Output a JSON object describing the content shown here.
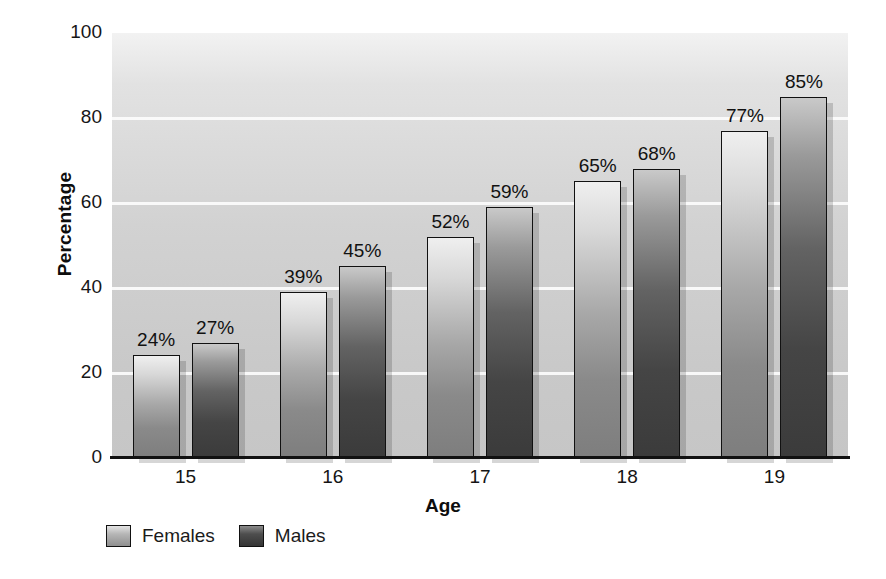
{
  "chart_data": {
    "type": "bar",
    "title": "",
    "subtitle": "",
    "xlabel": "Age",
    "ylabel": "Percentage",
    "categories": [
      "15",
      "16",
      "17",
      "18",
      "19"
    ],
    "series": [
      {
        "name": "Females",
        "color": "#b0b0b0",
        "values": [
          24,
          39,
          52,
          65,
          77
        ],
        "labels": [
          "24%",
          "39%",
          "52%",
          "65%",
          "77%"
        ]
      },
      {
        "name": "Males",
        "color": "#4a4a4a",
        "values": [
          27,
          45,
          59,
          68,
          85
        ],
        "labels": [
          "27%",
          "45%",
          "59%",
          "68%",
          "85%"
        ]
      }
    ],
    "ylim": [
      0,
      100
    ],
    "y_ticks": [
      0,
      20,
      40,
      60,
      80,
      100
    ],
    "y_tick_labels": [
      "0",
      "20",
      "40",
      "60",
      "80",
      "100"
    ],
    "gridlines": true,
    "gridline_values": [
      20,
      40,
      60,
      80
    ],
    "legend_position": "bottom-left",
    "data_labels": true,
    "plot_background": "#d0d0d0"
  },
  "legend": {
    "items": [
      {
        "label": "Females"
      },
      {
        "label": "Males"
      }
    ]
  },
  "axes": {
    "x_title": "Age",
    "y_title": "Percentage"
  }
}
